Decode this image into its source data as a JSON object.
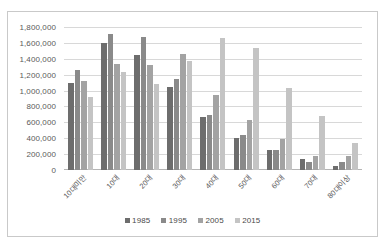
{
  "chart_data": {
    "type": "bar",
    "title": "",
    "xlabel": "",
    "ylabel": "",
    "ylim": [
      0,
      1800000
    ],
    "ytick_step": 200000,
    "grid": true,
    "legend_position": "bottom",
    "categories": [
      "10대미만",
      "10대",
      "20대",
      "30대",
      "40대",
      "50대",
      "60대",
      "70대",
      "80대이상"
    ],
    "ytick_labels": [
      "1,800,000",
      "1,600,000",
      "1,400,000",
      "1,200,000",
      "1,000,000",
      "800,000",
      "600,000",
      "400,000",
      "200,000",
      "0"
    ],
    "ytick_values": [
      1800000,
      1600000,
      1400000,
      1200000,
      1000000,
      800000,
      600000,
      400000,
      200000,
      0
    ],
    "series": [
      {
        "name": "1985",
        "color": "#6d6d6d",
        "values": [
          1090000,
          1595000,
          1450000,
          1045000,
          665000,
          400000,
          258000,
          142000,
          55000
        ]
      },
      {
        "name": "1995",
        "color": "#8a8a8a",
        "values": [
          1262000,
          1712000,
          1678000,
          1140000,
          692000,
          435000,
          252000,
          100000,
          100000
        ]
      },
      {
        "name": "2005",
        "color": "#a3a3a3",
        "values": [
          1118000,
          1335000,
          1318000,
          1462000,
          940000,
          632000,
          385000,
          178000,
          178000
        ]
      },
      {
        "name": "2015",
        "color": "#c4c4c4",
        "values": [
          925000,
          1235000,
          1082000,
          1378000,
          1658000,
          1540000,
          1035000,
          685000,
          338000
        ]
      }
    ],
    "series_values_by_group": [
      [
        1090000,
        1262000,
        1118000,
        925000
      ],
      [
        1595000,
        1712000,
        1335000,
        1235000
      ],
      [
        1450000,
        1678000,
        1318000,
        1082000
      ],
      [
        1045000,
        1678000,
        1462000,
        1378000
      ],
      [
        665000,
        1140000,
        1450000,
        1658000
      ],
      [
        400000,
        692000,
        940000,
        1540000
      ],
      [
        258000,
        435000,
        632000,
        1035000
      ],
      [
        142000,
        252000,
        385000,
        685000
      ],
      [
        55000,
        100000,
        178000,
        338000
      ]
    ]
  },
  "legend": {
    "items": [
      {
        "label": "1985",
        "color": "#6d6d6d"
      },
      {
        "label": "1995",
        "color": "#8a8a8a"
      },
      {
        "label": "2005",
        "color": "#a3a3a3"
      },
      {
        "label": "2015",
        "color": "#c4c4c4"
      }
    ]
  }
}
